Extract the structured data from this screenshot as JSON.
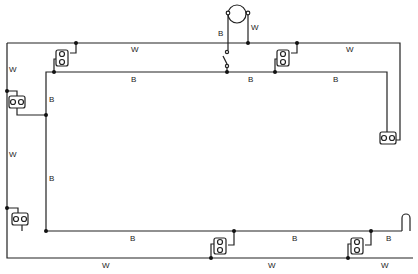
{
  "diagram": {
    "type": "wiring-diagram",
    "wire_color": "#222222",
    "labels": [
      {
        "id": "w-top-1",
        "text": "W",
        "x": 131,
        "y": 46
      },
      {
        "id": "w-top-2",
        "text": "W",
        "x": 346,
        "y": 46
      },
      {
        "id": "b-mid-1",
        "text": "B",
        "x": 131,
        "y": 76
      },
      {
        "id": "b-mid-2",
        "text": "B",
        "x": 248,
        "y": 76
      },
      {
        "id": "b-mid-3",
        "text": "B",
        "x": 333,
        "y": 76
      },
      {
        "id": "w-left-1",
        "text": "W",
        "x": 9,
        "y": 66
      },
      {
        "id": "b-left-1",
        "text": "B",
        "x": 49,
        "y": 96
      },
      {
        "id": "w-left-2",
        "text": "W",
        "x": 9,
        "y": 151
      },
      {
        "id": "b-left-2",
        "text": "B",
        "x": 49,
        "y": 175
      },
      {
        "id": "b-motor",
        "text": "B",
        "x": 218,
        "y": 30
      },
      {
        "id": "w-motor",
        "text": "W",
        "x": 251,
        "y": 24
      },
      {
        "id": "b-bot-1",
        "text": "B",
        "x": 130,
        "y": 235
      },
      {
        "id": "b-bot-2",
        "text": "B",
        "x": 292,
        "y": 235
      },
      {
        "id": "b-bot-3",
        "text": "B",
        "x": 386,
        "y": 235
      },
      {
        "id": "w-bot-1",
        "text": "W",
        "x": 102,
        "y": 262
      },
      {
        "id": "w-bot-2",
        "text": "W",
        "x": 268,
        "y": 262
      },
      {
        "id": "w-bot-3",
        "text": "W",
        "x": 381,
        "y": 262
      }
    ],
    "components": [
      "motor",
      "switch",
      "lamp-socket-1",
      "lamp-socket-2",
      "lamp-socket-3",
      "lamp-socket-4",
      "lamp-socket-5",
      "lamp-socket-6",
      "lamp-socket-7",
      "terminal-loop"
    ]
  }
}
